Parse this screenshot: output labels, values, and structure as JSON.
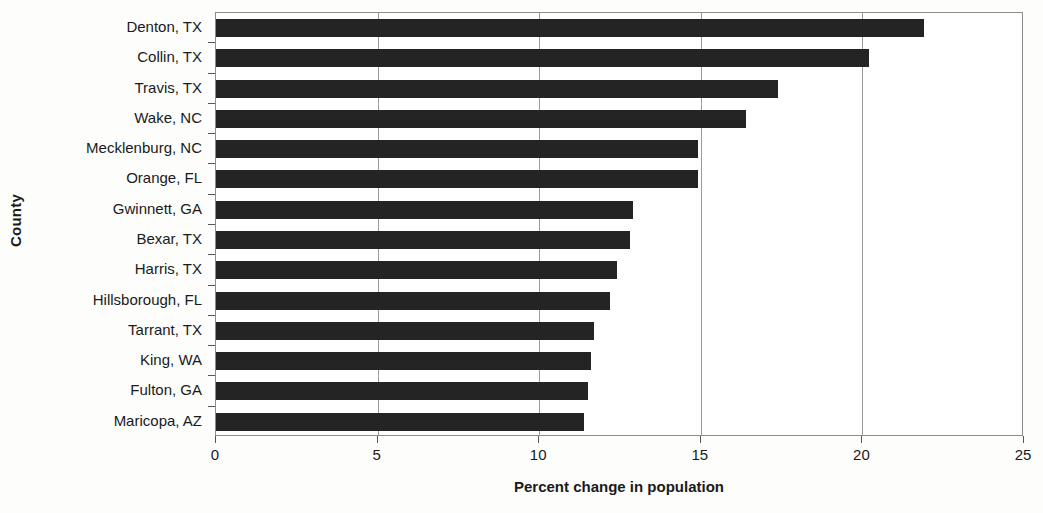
{
  "chart_data": {
    "type": "bar",
    "orientation": "horizontal",
    "title": "",
    "xlabel": "Percent change in population",
    "ylabel": "County",
    "xlim": [
      0,
      25
    ],
    "xticks": [
      0,
      5,
      10,
      15,
      20,
      25
    ],
    "xtick_labels": [
      "0",
      "5",
      "10",
      "15",
      "20",
      "25"
    ],
    "grid": true,
    "grid_axis": "x",
    "legend": false,
    "bar_color": "#242424",
    "plot_background": "#ffffff",
    "categories": [
      "Denton, TX",
      "Collin, TX",
      "Travis, TX",
      "Wake, NC",
      "Mecklenburg, NC",
      "Orange, FL",
      "Gwinnett, GA",
      "Bexar, TX",
      "Harris, TX",
      "Hillsborough, FL",
      "Tarrant, TX",
      "King, WA",
      "Fulton, GA",
      "Maricopa, AZ"
    ],
    "values": [
      21.9,
      20.2,
      17.4,
      16.4,
      14.9,
      14.9,
      12.9,
      12.8,
      12.4,
      12.2,
      11.7,
      11.6,
      11.5,
      11.4
    ]
  }
}
